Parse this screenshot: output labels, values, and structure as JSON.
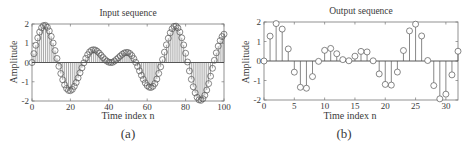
{
  "chart_data": [
    {
      "type": "line",
      "subtype": "stem",
      "title": "Input sequence",
      "xlabel": "Time index n",
      "ylabel": "Amplitude",
      "caption": "(a)",
      "xlim": [
        0,
        100
      ],
      "ylim": [
        -2,
        2
      ],
      "xticks": [
        0,
        20,
        40,
        60,
        80,
        100
      ],
      "yticks": [
        -2,
        -1,
        0,
        1,
        2
      ],
      "grid": false,
      "x_start": 0,
      "values": [
        0,
        0.46,
        0.894,
        1.276,
        1.585,
        1.803,
        1.919,
        1.928,
        1.831,
        1.637,
        1.356,
        1.01,
        0.62,
        0.21,
        -0.195,
        -0.572,
        -0.899,
        -1.161,
        -1.347,
        -1.447,
        -1.462,
        -1.396,
        -1.242,
        -1.041,
        -0.799,
        -0.535,
        -0.276,
        -0.018,
        0.215,
        0.405,
        0.548,
        0.634,
        0.664,
        0.645,
        0.58,
        0.488,
        0.372,
        0.256,
        0.151,
        0.07,
        0.016,
        -0.003,
        0.012,
        0.076,
        0.159,
        0.247,
        0.338,
        0.425,
        0.492,
        0.52,
        0.518,
        0.465,
        0.358,
        0.203,
        0.01,
        -0.203,
        -0.434,
        -0.663,
        -0.873,
        -1.06,
        -1.201,
        -1.281,
        -1.297,
        -1.237,
        -1.089,
        -0.862,
        -0.568,
        -0.223,
        0.152,
        0.538,
        0.918,
        1.26,
        1.544,
        1.754,
        1.874,
        1.888,
        1.791,
        1.583,
        1.284,
        0.912,
        0.481,
        0.025,
        -0.439,
        -0.874,
        -1.26,
        -1.577,
        -1.81,
        -1.941,
        -1.965,
        -1.883,
        -1.701,
        -1.432,
        -1.097,
        -0.711,
        -0.3,
        0.114,
        0.501,
        0.85,
        1.135,
        1.346,
        1.471
      ]
    },
    {
      "type": "line",
      "subtype": "stem",
      "title": "Output sequence",
      "xlabel": "Time index n",
      "ylabel": "Amplitude",
      "caption": "(b)",
      "xlim": [
        0,
        32
      ],
      "ylim": [
        -2,
        2
      ],
      "xticks": [
        0,
        5,
        10,
        15,
        20,
        25,
        30
      ],
      "yticks": [
        -2,
        -1,
        0,
        1,
        2
      ],
      "grid": false,
      "x_start": 0,
      "values": [
        0,
        1.276,
        1.919,
        1.637,
        0.62,
        -0.572,
        -1.347,
        -1.396,
        -0.799,
        -0.018,
        0.548,
        0.645,
        0.372,
        0.07,
        0.012,
        0.247,
        0.492,
        0.465,
        0.01,
        -0.663,
        -1.201,
        -1.237,
        -0.568,
        0.538,
        1.544,
        1.888,
        1.284,
        0.025,
        -1.26,
        -1.941,
        -1.701,
        -0.711,
        0.501
      ]
    }
  ]
}
